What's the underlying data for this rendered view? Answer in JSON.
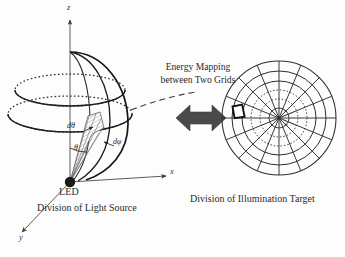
{
  "figure": {
    "background_color": "#fdfdfd",
    "ink_color": "#231f20",
    "accent_color": "#5a5a5a"
  },
  "left_diagram": {
    "name": "Division of Light Source",
    "caption": "Division of Light Source",
    "source_label": "LED",
    "axes": [
      {
        "id": "z",
        "label": "z",
        "direction": "up"
      },
      {
        "id": "x",
        "label": "x",
        "direction": "right"
      },
      {
        "id": "y",
        "label": "y",
        "direction": "down-left"
      }
    ],
    "angle_labels": [
      {
        "id": "d-theta",
        "label": "dθ"
      },
      {
        "id": "theta",
        "label": "θ"
      },
      {
        "id": "d-phi",
        "label": "dφ"
      }
    ],
    "geometry": {
      "shape": "hemisphere",
      "latitude_rings": 2,
      "ring_style": "dotted",
      "solid_angle_cell": "shaded"
    }
  },
  "center_annotation": {
    "title_line_1": "Energy Mapping",
    "title_line_2": "between Two Grids",
    "arrow": "double-headed-horizontal-arrow",
    "leader_line_style": "dashed"
  },
  "right_diagram": {
    "name": "Division of Illumination Target",
    "caption": "Division of Illumination Target",
    "geometry": {
      "shape": "polar-grid",
      "rings": 6,
      "spokes": 16,
      "dotted_rings": 2,
      "highlighted_cell": true
    },
    "inner_labels": [
      {
        "id": "r-label",
        "label": "r"
      },
      {
        "id": "dr-label",
        "label": "dr"
      }
    ]
  }
}
